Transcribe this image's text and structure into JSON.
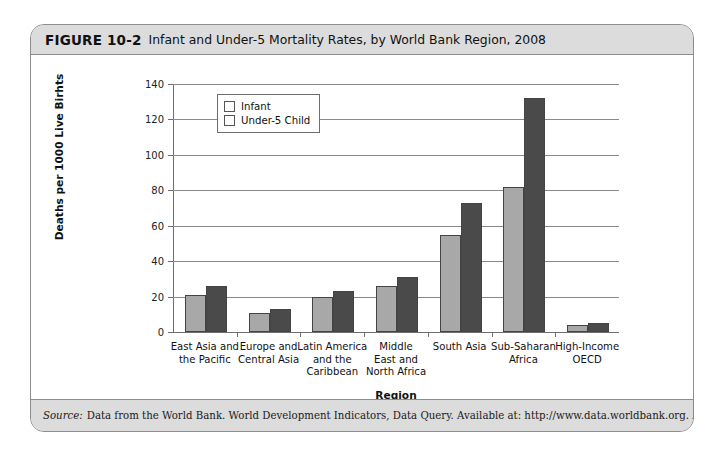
{
  "figure": {
    "number": "FIGURE 10-2",
    "title": "Infant and Under-5 Mortality Rates, by World Bank Region, 2008",
    "source_label": "Source:",
    "source_text": "Data from the World Bank. World Development Indicators, Data Query. Available at: http://www.data.worldbank.org. Accessed January 15, 2011."
  },
  "colors": {
    "infant": "#a8a8a8",
    "under5": "#4a4a4a",
    "band": "#dcdcdc",
    "border": "#8d8d8d",
    "gridline": "#8a8a8a"
  },
  "chart_data": {
    "type": "bar",
    "title": "Infant and Under-5 Mortality Rates, by World Bank Region, 2008",
    "xlabel": "Region",
    "ylabel": "Deaths per 1000 Live Birhts",
    "ylim": [
      0,
      140
    ],
    "yticks": [
      0,
      20,
      40,
      60,
      80,
      100,
      120,
      140
    ],
    "grid": true,
    "legend_position": "top-left",
    "categories": [
      "East Asia and\nthe Pacific",
      "Europe and\nCentral Asia",
      "Latin America\nand the\nCaribbean",
      "Middle\nEast and\nNorth Africa",
      "South Asia",
      "Sub-Saharan\nAfrica",
      "High-Income\nOECD"
    ],
    "series": [
      {
        "name": "Infant",
        "values": [
          21,
          11,
          20,
          26,
          55,
          82,
          4
        ]
      },
      {
        "name": "Under-5 Child",
        "values": [
          26,
          13,
          23,
          31,
          73,
          132,
          5
        ]
      }
    ]
  }
}
